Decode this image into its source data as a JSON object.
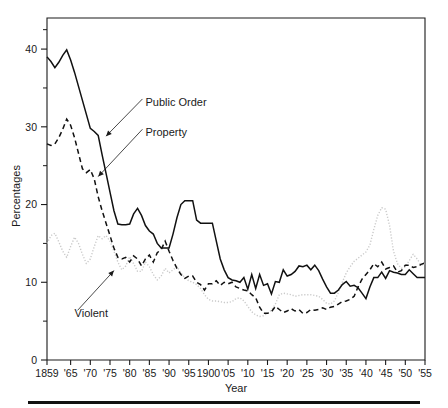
{
  "chart_data": {
    "type": "line",
    "title": "",
    "xlabel": "Year",
    "ylabel": "Percentages",
    "xlim": [
      1859,
      1955
    ],
    "ylim": [
      0,
      44
    ],
    "grid": false,
    "legend": "inline-annotations",
    "y_ticks_major": [
      0,
      10,
      20,
      30,
      40
    ],
    "y_ticks_minor": [
      5,
      15,
      25,
      35
    ],
    "y_ticklabels": [
      "0",
      "10",
      "20",
      "30",
      "40"
    ],
    "x_ticks": [
      1859,
      1865,
      1870,
      1875,
      1880,
      1885,
      1890,
      1895,
      1900,
      1905,
      1910,
      1915,
      1920,
      1925,
      1930,
      1935,
      1940,
      1945,
      1950,
      1955
    ],
    "x_ticklabels": [
      "1859",
      "'65",
      "'70",
      "'75",
      "'80",
      "'85",
      "'90",
      "'95",
      "1900",
      "'05",
      "'10",
      "'15",
      "'20",
      "'25",
      "'30",
      "'35",
      "'40",
      "'45",
      "'50",
      "'55"
    ],
    "annotations": [
      {
        "label": "Public Order",
        "x": 1884,
        "y": 33.2,
        "points_to_x": 1874,
        "points_to_y": 28.8
      },
      {
        "label": "Property",
        "x": 1884,
        "y": 29.3,
        "points_to_x": 1872,
        "points_to_y": 23.6
      },
      {
        "label": "Violent",
        "x": 1866,
        "y": 6.0,
        "points_to_x": 1876,
        "points_to_y": 11.5
      }
    ],
    "series": [
      {
        "name": "Public Order",
        "style": "solid",
        "color": "#111111",
        "x": [
          1859,
          1860,
          1861,
          1862,
          1863,
          1864,
          1865,
          1866,
          1867,
          1868,
          1869,
          1870,
          1871,
          1872,
          1873,
          1874,
          1875,
          1876,
          1877,
          1878,
          1879,
          1880,
          1881,
          1882,
          1883,
          1884,
          1885,
          1886,
          1887,
          1888,
          1889,
          1890,
          1891,
          1892,
          1893,
          1894,
          1895,
          1896,
          1897,
          1898,
          1899,
          1900,
          1901,
          1902,
          1903,
          1904,
          1905,
          1906,
          1907,
          1908,
          1909,
          1910,
          1911,
          1912,
          1913,
          1914,
          1915,
          1916,
          1917,
          1918,
          1919,
          1920,
          1921,
          1922,
          1923,
          1924,
          1925,
          1926,
          1927,
          1928,
          1929,
          1930,
          1931,
          1932,
          1933,
          1934,
          1935,
          1936,
          1937,
          1938,
          1939,
          1940,
          1941,
          1942,
          1943,
          1944,
          1945,
          1946,
          1947,
          1948,
          1949,
          1950,
          1951,
          1952,
          1953,
          1954,
          1955
        ],
        "y": [
          39.0,
          38.4,
          37.6,
          38.3,
          39.2,
          39.9,
          38.6,
          37.0,
          35.2,
          33.4,
          31.6,
          29.8,
          29.4,
          28.9,
          26.4,
          24.0,
          21.6,
          19.2,
          17.5,
          17.4,
          17.4,
          17.5,
          18.8,
          19.5,
          18.6,
          17.3,
          16.6,
          16.2,
          15.0,
          14.4,
          14.4,
          14.4,
          16.2,
          18.3,
          20.0,
          20.5,
          20.5,
          20.5,
          18.0,
          17.6,
          17.6,
          17.6,
          17.6,
          15.3,
          13.0,
          11.6,
          10.6,
          10.3,
          10.2,
          10.0,
          10.6,
          9.1,
          11.0,
          9.2,
          11.0,
          9.6,
          9.8,
          8.5,
          10.1,
          10.0,
          11.6,
          10.8,
          11.0,
          11.4,
          12.1,
          12.0,
          12.2,
          11.6,
          12.2,
          11.5,
          10.4,
          9.4,
          8.6,
          8.6,
          9.0,
          9.7,
          10.1,
          9.5,
          9.6,
          9.3,
          8.6,
          7.9,
          9.4,
          10.6,
          10.6,
          11.3,
          10.5,
          11.5,
          11.3,
          11.2,
          11.0,
          11.0,
          11.6,
          11.1,
          10.6,
          10.6,
          10.6
        ]
      },
      {
        "name": "Property",
        "style": "dashed",
        "color": "#111111",
        "x": [
          1859,
          1860,
          1861,
          1862,
          1863,
          1864,
          1865,
          1866,
          1867,
          1868,
          1869,
          1870,
          1871,
          1872,
          1873,
          1874,
          1875,
          1876,
          1877,
          1878,
          1879,
          1880,
          1881,
          1882,
          1883,
          1884,
          1885,
          1886,
          1887,
          1888,
          1889,
          1890,
          1891,
          1892,
          1893,
          1894,
          1895,
          1896,
          1897,
          1898,
          1899,
          1900,
          1901,
          1902,
          1903,
          1904,
          1905,
          1906,
          1907,
          1908,
          1909,
          1910,
          1911,
          1912,
          1913,
          1914,
          1915,
          1916,
          1917,
          1918,
          1919,
          1920,
          1921,
          1922,
          1923,
          1924,
          1925,
          1926,
          1927,
          1928,
          1929,
          1930,
          1931,
          1932,
          1933,
          1934,
          1935,
          1936,
          1937,
          1938,
          1939,
          1940,
          1941,
          1942,
          1943,
          1944,
          1945,
          1946,
          1947,
          1948,
          1949,
          1950,
          1951,
          1952,
          1953,
          1954,
          1955
        ],
        "y": [
          27.8,
          27.6,
          27.8,
          28.6,
          29.7,
          31.0,
          30.2,
          28.6,
          26.6,
          24.6,
          24.1,
          24.5,
          23.3,
          21.0,
          19.2,
          17.6,
          16.0,
          14.4,
          13.2,
          13.0,
          13.2,
          12.6,
          13.4,
          13.0,
          12.1,
          13.0,
          13.5,
          12.6,
          13.8,
          14.2,
          15.3,
          14.0,
          12.8,
          11.8,
          11.0,
          10.5,
          10.8,
          10.8,
          10.0,
          9.7,
          9.0,
          9.8,
          9.8,
          10.2,
          9.6,
          10.0,
          9.8,
          10.0,
          9.4,
          9.2,
          9.0,
          8.9,
          8.4,
          8.0,
          6.8,
          6.0,
          6.0,
          6.2,
          6.9,
          6.5,
          6.1,
          6.3,
          6.6,
          6.3,
          6.5,
          6.0,
          6.1,
          6.5,
          6.4,
          6.5,
          6.7,
          6.5,
          6.8,
          6.9,
          7.2,
          7.5,
          7.6,
          7.8,
          8.2,
          9.4,
          10.4,
          11.0,
          11.6,
          12.4,
          12.0,
          12.6,
          11.7,
          11.9,
          12.1,
          11.3,
          11.5,
          12.2,
          12.2,
          11.9,
          12.0,
          12.3,
          12.5
        ]
      },
      {
        "name": "Violent",
        "style": "dotted",
        "color": "#c9c9c9",
        "x": [
          1859,
          1860,
          1861,
          1862,
          1863,
          1864,
          1865,
          1866,
          1867,
          1868,
          1869,
          1870,
          1871,
          1872,
          1873,
          1874,
          1875,
          1876,
          1877,
          1878,
          1879,
          1880,
          1881,
          1882,
          1883,
          1884,
          1885,
          1886,
          1887,
          1888,
          1889,
          1890,
          1891,
          1892,
          1893,
          1894,
          1895,
          1896,
          1897,
          1898,
          1899,
          1900,
          1901,
          1902,
          1903,
          1904,
          1905,
          1906,
          1907,
          1908,
          1909,
          1910,
          1911,
          1912,
          1913,
          1914,
          1915,
          1916,
          1917,
          1918,
          1919,
          1920,
          1921,
          1922,
          1923,
          1924,
          1925,
          1926,
          1927,
          1928,
          1929,
          1930,
          1931,
          1932,
          1933,
          1934,
          1935,
          1936,
          1937,
          1938,
          1939,
          1940,
          1941,
          1942,
          1943,
          1944,
          1945,
          1946,
          1947,
          1948,
          1949,
          1950,
          1951,
          1952,
          1953,
          1954,
          1955
        ],
        "y": [
          15.0,
          16.0,
          16.3,
          15.2,
          14.0,
          13.2,
          14.6,
          15.8,
          15.0,
          13.6,
          12.4,
          13.0,
          14.6,
          16.0,
          15.6,
          16.0,
          15.3,
          14.0,
          12.6,
          11.6,
          12.1,
          13.3,
          12.4,
          11.4,
          11.4,
          12.6,
          12.0,
          11.0,
          10.3,
          10.8,
          11.8,
          11.2,
          11.6,
          12.0,
          11.2,
          10.6,
          10.2,
          10.0,
          9.7,
          9.2,
          8.4,
          7.8,
          7.6,
          7.6,
          7.5,
          7.4,
          7.4,
          7.5,
          7.9,
          8.0,
          7.6,
          6.9,
          6.2,
          5.8,
          5.6,
          5.7,
          6.0,
          6.4,
          7.2,
          8.4,
          8.6,
          8.5,
          8.4,
          8.2,
          8.3,
          8.4,
          8.4,
          8.4,
          8.3,
          8.2,
          7.8,
          7.3,
          7.2,
          7.6,
          8.7,
          10.0,
          11.2,
          12.0,
          12.7,
          13.1,
          13.5,
          13.9,
          14.8,
          16.8,
          18.6,
          19.6,
          19.4,
          17.3,
          14.0,
          12.4,
          11.8,
          12.0,
          12.8,
          13.6,
          13.0,
          12.2,
          12.4
        ]
      }
    ]
  }
}
